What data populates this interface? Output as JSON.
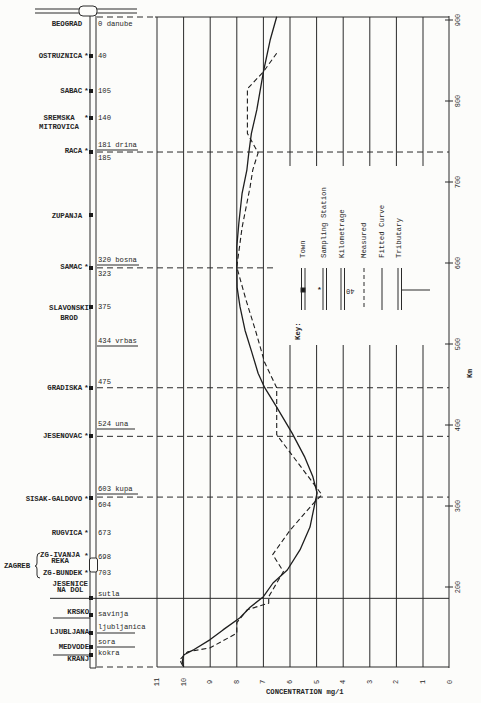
{
  "figure": {
    "sampling_marker": "*",
    "group_label": "ZAGREB",
    "stations": [
      {
        "name": "BEOGRAD",
        "km_label": "0 danube",
        "sampling_station": false
      },
      {
        "name": "OSTRUZNICA",
        "km_label": "40",
        "sampling_station": true
      },
      {
        "name": "SABAC",
        "km_label": "105",
        "sampling_station": true
      },
      {
        "name": "SREMSKA",
        "name_line2": "MITROVICA",
        "km_label": "140",
        "sampling_station": true
      },
      {
        "name": "RACA",
        "tributary_label": "181 drina",
        "km_label": "185",
        "sampling_station": true
      },
      {
        "name": "ZUPANJA",
        "sampling_station": false
      },
      {
        "name": "SAMAC",
        "tributary_label": "320 bosna",
        "km_label": "323",
        "sampling_station": true
      },
      {
        "name": "SLAVONSKI",
        "name_line2": "BROD",
        "km_label": "375",
        "sampling_station": false
      },
      {
        "name": "GRADISKA",
        "km_label": "475",
        "sampling_station": true
      },
      {
        "name": "JESENOVAC",
        "sampling_station": true
      },
      {
        "name": "SISAK-GALDOVO",
        "tributary_label": "603 kupa",
        "km_label": "604",
        "sampling_station": true
      },
      {
        "name": "RUGVICA",
        "km_label": "673",
        "sampling_station": true
      },
      {
        "name": "ZG-IVANJA",
        "name_line2": "REKA",
        "km_label": "698",
        "sampling_station": true
      },
      {
        "name": "ZG-BUNDEK",
        "km_label": "703",
        "sampling_station": true
      },
      {
        "name": "JESENICE",
        "name_line2": "NA DOL",
        "tributary_label": "sutla"
      },
      {
        "name": "KRSKO",
        "tributary_label": "savinja"
      },
      {
        "name": "LJUBLJANA",
        "tributary_label": "ljubljanica"
      },
      {
        "name": "MEDVODE",
        "tributary_label": "sora"
      },
      {
        "name": "KRANJ",
        "tributary_label": "kokra"
      }
    ],
    "standalone_tributaries": [
      "434 vrbas",
      "524 una"
    ]
  },
  "legend": {
    "title": "Key:",
    "items": [
      {
        "label": "Town",
        "symbol": "town-square"
      },
      {
        "label": "Sampling Station",
        "symbol": "asterisk"
      },
      {
        "label": "Kilometrage",
        "symbol": "km-number",
        "sample": "40"
      },
      {
        "label": "Measured",
        "symbol": "dashed-line"
      },
      {
        "label": "Fitted Curve",
        "symbol": "solid-line"
      },
      {
        "label": "Tributary",
        "symbol": "branch-line"
      }
    ]
  },
  "chart_data": {
    "type": "line",
    "title": "",
    "xlabel": "CONCENTRATION mg/1",
    "ylabel": "Km",
    "x_ticks": [
      "11",
      "10",
      "9",
      "8",
      "7",
      "6",
      "5",
      "4",
      "3",
      "2",
      "1",
      "0"
    ],
    "y_ticks": [
      "200",
      "300",
      "400",
      "500",
      "600",
      "700",
      "800",
      "900"
    ],
    "xlim": [
      11,
      0
    ],
    "ylim": [
      100,
      905
    ],
    "grid": true,
    "orientation": "concentration on x (reversed), river km on y",
    "series": [
      {
        "name": "Fitted Curve",
        "style": "solid",
        "points_km_conc": [
          [
            904,
            6.5
          ],
          [
            875,
            6.75
          ],
          [
            836,
            7.0
          ],
          [
            789,
            7.25
          ],
          [
            760,
            7.45
          ],
          [
            736,
            7.55
          ],
          [
            715,
            7.62
          ],
          [
            686,
            7.8
          ],
          [
            650,
            7.92
          ],
          [
            620,
            8.0
          ],
          [
            594,
            8.0
          ],
          [
            570,
            7.99
          ],
          [
            546,
            7.88
          ],
          [
            517,
            7.69
          ],
          [
            489,
            7.43
          ],
          [
            464,
            7.2
          ],
          [
            446,
            6.95
          ],
          [
            422,
            6.5
          ],
          [
            390,
            5.92
          ],
          [
            360,
            5.44
          ],
          [
            336,
            5.14
          ],
          [
            316,
            4.98
          ],
          [
            304,
            5.06
          ],
          [
            274,
            5.25
          ],
          [
            246,
            5.62
          ],
          [
            221,
            6.1
          ],
          [
            205,
            6.64
          ],
          [
            188,
            7.0
          ],
          [
            175,
            7.5
          ],
          [
            162,
            7.88
          ],
          [
            147,
            8.52
          ],
          [
            135,
            9.0
          ],
          [
            122,
            9.65
          ],
          [
            116,
            10.0
          ],
          [
            108,
            10.05
          ],
          [
            101,
            10.0
          ]
        ]
      },
      {
        "name": "Measured",
        "style": "dashed",
        "points_km_conc": [
          [
            859,
            6.5
          ],
          [
            836,
            7.0
          ],
          [
            815,
            7.6
          ],
          [
            760,
            7.6
          ],
          [
            736,
            7.2
          ],
          [
            715,
            7.4
          ],
          [
            694,
            7.5
          ],
          [
            644,
            7.8
          ],
          [
            595,
            8.0
          ],
          [
            554,
            7.65
          ],
          [
            517,
            7.3
          ],
          [
            477,
            6.95
          ],
          [
            446,
            6.5
          ],
          [
            388,
            6.5
          ],
          [
            314,
            4.8
          ],
          [
            304,
            5.1
          ],
          [
            270,
            6.0
          ],
          [
            240,
            6.65
          ],
          [
            219,
            6.25
          ],
          [
            188,
            6.8
          ],
          [
            180,
            6.8
          ],
          [
            172,
            7.6
          ],
          [
            156,
            8.0
          ],
          [
            143,
            8.0
          ],
          [
            125,
            9.0
          ],
          [
            120,
            9.85
          ],
          [
            110,
            10.15
          ],
          [
            101,
            10.0
          ]
        ]
      }
    ],
    "reference_lines": [
      {
        "km": 737,
        "station": "RACA",
        "style": "dashed"
      },
      {
        "km": 594,
        "station": "SAMAC",
        "style": "dashed"
      },
      {
        "km": 446,
        "station": "GRADISKA",
        "style": "dashed"
      },
      {
        "km": 386,
        "station": "JESENOVAC",
        "style": "dashed"
      },
      {
        "km": 311,
        "station": "SISAK-GALDOVO",
        "style": "dashed"
      },
      {
        "km": 186,
        "station": "JESENICE NA DOL (sutla)",
        "style": "solid"
      }
    ]
  }
}
